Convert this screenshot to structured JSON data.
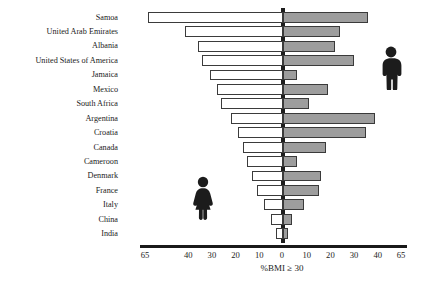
{
  "chart_data": {
    "type": "bar",
    "orientation": "horizontal",
    "style": "diverging-population-pyramid",
    "title": "",
    "xlabel": "%BMI ≥ 30",
    "ylabel": "",
    "grid": false,
    "legend_position": "inside-plot-pictograms",
    "axis": {
      "left_ticks": [
        65,
        40,
        30,
        20,
        10,
        0
      ],
      "right_ticks": [
        0,
        10,
        20,
        30,
        40,
        65
      ],
      "tick_labels": [
        "65",
        "40",
        "30",
        "20",
        "10",
        "0",
        "10",
        "20",
        "30",
        "40",
        "65"
      ],
      "note_scale": "non-linear: compressed between 40 and 65"
    },
    "series": [
      {
        "name": "Female",
        "side": "left",
        "fill": "#ffffff",
        "stroke": "#3b3b3b",
        "values": [
          63,
          42,
          36,
          34,
          31,
          28,
          26,
          22,
          19,
          17,
          15,
          13,
          11,
          8,
          5,
          3
        ]
      },
      {
        "name": "Male",
        "side": "right",
        "fill": "#9d9d9d",
        "stroke": "#3a3a3a",
        "values": [
          36,
          24,
          22,
          30,
          6,
          19,
          11,
          39,
          35,
          18,
          6,
          16,
          15,
          9,
          4,
          2
        ]
      }
    ],
    "categories": [
      "Samoa",
      "United Arab Emirates",
      "Albania",
      "United States of America",
      "Jamaica",
      "Mexico",
      "South Africa",
      "Argentina",
      "Croatia",
      "Canada",
      "Cameroon",
      "Denmark",
      "France",
      "Italy",
      "China",
      "India"
    ]
  },
  "pictograms": {
    "male": {
      "name": "male-figure-icon",
      "color": "#1c1c1c"
    },
    "female": {
      "name": "female-figure-icon",
      "color": "#1c1c1c"
    }
  }
}
